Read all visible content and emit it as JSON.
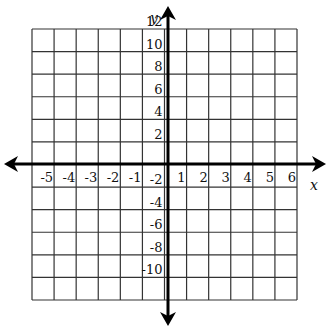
{
  "chart_data": {
    "type": "coordinate_grid",
    "title": "",
    "xlabel": "x",
    "ylabel": "y",
    "xlim": [
      -6,
      6
    ],
    "ylim": [
      -12,
      12
    ],
    "x_step": 1,
    "y_step": 2,
    "grid": true,
    "x_tick_labels": [
      "-5",
      "-4",
      "-3",
      "-2",
      "-1",
      "1",
      "2",
      "3",
      "4",
      "5",
      "6"
    ],
    "y_tick_labels": [
      "12",
      "10",
      "8",
      "6",
      "4",
      "2",
      "-2",
      "-4",
      "-6",
      "-8",
      "-10"
    ],
    "series": []
  },
  "axes": {
    "x_label": "x",
    "y_label": "y",
    "color": "#000000"
  },
  "grid": {
    "color": "#333333",
    "columns": 12,
    "rows": 12
  }
}
